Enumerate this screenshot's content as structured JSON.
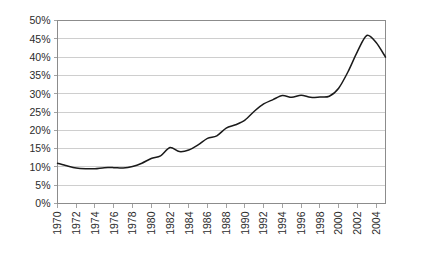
{
  "chart_data": {
    "type": "line",
    "title": "",
    "subtitle": "",
    "xlabel": "",
    "ylabel": "",
    "grid": true,
    "legend": false,
    "legend_position": "none",
    "line_color": "#1a1a1a",
    "grid_color": "#b9b9b9",
    "frame_color": "#8c8c8c",
    "xlim": [
      1970,
      2005
    ],
    "ylim": [
      0,
      50
    ],
    "y_tick_values": [
      0,
      5,
      10,
      15,
      20,
      25,
      30,
      35,
      40,
      45,
      50
    ],
    "y_tick_labels": [
      "0%",
      "5%",
      "10%",
      "15%",
      "20%",
      "25%",
      "30%",
      "35%",
      "40%",
      "45%",
      "50%"
    ],
    "x_tick_values": [
      1970,
      1972,
      1974,
      1976,
      1978,
      1980,
      1982,
      1984,
      1986,
      1988,
      1990,
      1992,
      1994,
      1996,
      1998,
      2000,
      2002,
      2004
    ],
    "x_tick_labels": [
      "1970",
      "1972",
      "1974",
      "1976",
      "1978",
      "1980",
      "1982",
      "1984",
      "1986",
      "1988",
      "1990",
      "1992",
      "1994",
      "1996",
      "1998",
      "2000",
      "2002",
      "2004"
    ],
    "x_tick_rotation": -90,
    "x": [
      1970,
      1971,
      1972,
      1973,
      1974,
      1975,
      1976,
      1977,
      1978,
      1979,
      1980,
      1981,
      1982,
      1983,
      1984,
      1985,
      1986,
      1987,
      1988,
      1989,
      1990,
      1991,
      1992,
      1993,
      1994,
      1995,
      1996,
      1997,
      1998,
      1999,
      2000,
      2001,
      2002,
      2003,
      2004,
      2005
    ],
    "values": [
      11.0,
      10.3,
      9.7,
      9.5,
      9.5,
      9.8,
      9.8,
      9.7,
      10.1,
      11.0,
      12.3,
      13.0,
      15.3,
      14.2,
      14.6,
      16.0,
      17.8,
      18.5,
      20.6,
      21.5,
      22.8,
      25.2,
      27.2,
      28.4,
      29.5,
      29.0,
      29.6,
      29.0,
      29.1,
      29.3,
      31.5,
      36.0,
      41.5,
      45.9,
      44.0,
      40.0
    ],
    "series": [
      {
        "name": "series-1",
        "values": [
          11.0,
          10.3,
          9.7,
          9.5,
          9.5,
          9.8,
          9.8,
          9.7,
          10.1,
          11.0,
          12.3,
          13.0,
          15.3,
          14.2,
          14.6,
          16.0,
          17.8,
          18.5,
          20.6,
          21.5,
          22.8,
          25.2,
          27.2,
          28.4,
          29.5,
          29.0,
          29.6,
          29.0,
          29.1,
          29.3,
          31.5,
          36.0,
          41.5,
          45.9,
          44.0,
          40.0
        ]
      }
    ],
    "notable_points": {
      "start_1970": 11.0,
      "trough_1974": 9.5,
      "local_peak_1982": 15.3,
      "local_dip_1983": 14.2,
      "plateau_1994_1999": 29.3,
      "peak_2003": 45.9,
      "end_value": 36.5
    }
  }
}
